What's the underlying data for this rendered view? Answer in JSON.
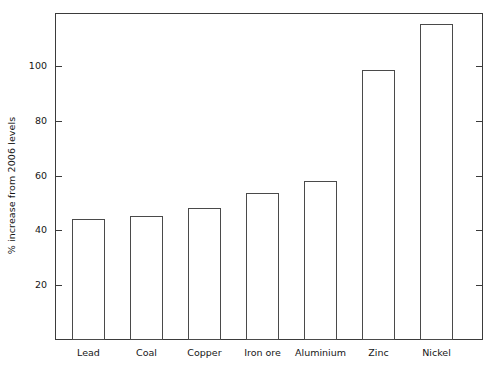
{
  "chart_data": {
    "type": "bar",
    "title": "",
    "xlabel": "",
    "ylabel": "% increase from 2006 levels",
    "categories": [
      "Lead",
      "Coal",
      "Copper",
      "Iron ore",
      "Aluminium",
      "Zinc",
      "Nickel"
    ],
    "values": [
      44.5,
      45.5,
      48.5,
      54,
      58.5,
      99,
      116
    ],
    "ylim": [
      0,
      120
    ],
    "yticks": [
      20,
      40,
      60,
      80,
      100
    ],
    "ytick_labels": [
      "20",
      "40",
      "60",
      "80",
      "100"
    ],
    "grid": false,
    "legend": null,
    "bar_fill_color": "#ffffff",
    "bar_edge_color": "#4a4a4a",
    "axis_color": "#3b3b3b",
    "text_color": "#161616"
  }
}
